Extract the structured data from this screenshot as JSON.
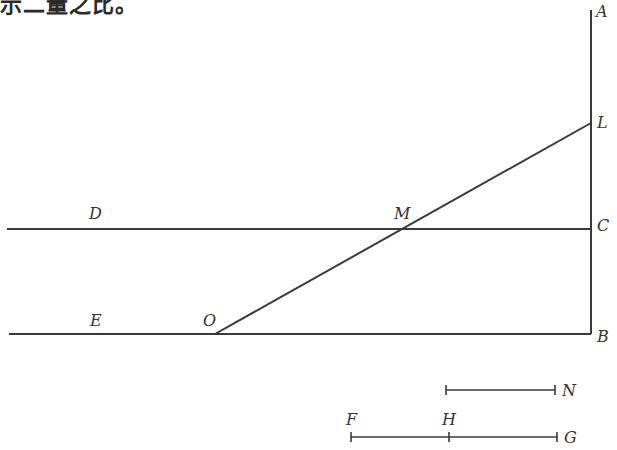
{
  "caption": "示二量之比。",
  "colors": {
    "stroke": "#3a3a3a",
    "text": "#333333",
    "background": "#ffffff"
  },
  "points": {
    "A": {
      "label": "A",
      "x": 591,
      "y": 10
    },
    "L": {
      "label": "L",
      "x": 591,
      "y": 123
    },
    "C": {
      "label": "C",
      "x": 591,
      "y": 229
    },
    "B": {
      "label": "B",
      "x": 591,
      "y": 334
    },
    "D": {
      "label": "D",
      "x": 95,
      "y": 229
    },
    "M": {
      "label": "M",
      "x": 402,
      "y": 229
    },
    "E": {
      "label": "E",
      "x": 95,
      "y": 334
    },
    "O": {
      "label": "O",
      "x": 215,
      "y": 334
    },
    "N": {
      "label": "N",
      "x": 555,
      "y": 390
    },
    "F": {
      "label": "F",
      "x": 351,
      "y": 437
    },
    "H": {
      "label": "H",
      "x": 449,
      "y": 437
    },
    "G": {
      "label": "G",
      "x": 557,
      "y": 437
    }
  },
  "lines": [
    {
      "name": "AB",
      "x1": 591,
      "y1": 10,
      "x2": 591,
      "y2": 334
    },
    {
      "name": "DC",
      "x1": 7,
      "y1": 229,
      "x2": 591,
      "y2": 229
    },
    {
      "name": "EB",
      "x1": 9,
      "y1": 334,
      "x2": 591,
      "y2": 334
    },
    {
      "name": "OL",
      "x1": 215,
      "y1": 334,
      "x2": 591,
      "y2": 123
    }
  ],
  "segments": [
    {
      "name": "N-segment",
      "x1": 446,
      "y1": 390,
      "x2": 555,
      "y2": 390
    },
    {
      "name": "FG-segment",
      "x1": 351,
      "y1": 437,
      "x2": 557,
      "y2": 437,
      "ticks": [
        449
      ]
    }
  ]
}
